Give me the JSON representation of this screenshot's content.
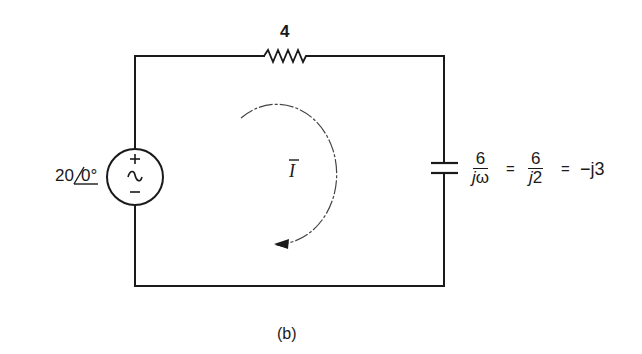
{
  "diagram": {
    "type": "ac-circuit-phasor",
    "caption": "(b)",
    "source": {
      "magnitude": "20",
      "angle": "0°",
      "label_prefix": "20",
      "label_angle": "0°",
      "polarity_plus": "+",
      "polarity_minus": "−",
      "symbol": "∼"
    },
    "resistor": {
      "value": "4"
    },
    "capacitor": {
      "expr_num1": "6",
      "expr_den1_j": "j",
      "expr_den1_w": "ω",
      "equals1": "=",
      "expr_num2": "6",
      "expr_den2_j": "j",
      "expr_den2_v": "2",
      "equals2": "=",
      "result": "−j3"
    },
    "current": {
      "label": "I",
      "direction": "clockwise"
    },
    "colors": {
      "stroke": "#1a1a1a",
      "background": "#ffffff"
    }
  }
}
